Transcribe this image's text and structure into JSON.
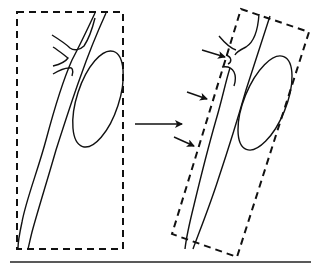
{
  "diagram": {
    "type": "schematic",
    "panels": [
      {
        "id": "before",
        "label": "",
        "elements": [
          "dashed-rectangle",
          "vessel",
          "branches",
          "ellipse"
        ]
      },
      {
        "id": "after",
        "label": "",
        "elements": [
          "rotated-dashed-rectangle",
          "vessel",
          "branch",
          "ellipse",
          "pointer-arrows"
        ]
      }
    ],
    "transition_arrow": {
      "direction": "right"
    },
    "pointer_arrows_count": 3,
    "colors": {
      "stroke": "#111111",
      "background": "#ffffff"
    }
  }
}
